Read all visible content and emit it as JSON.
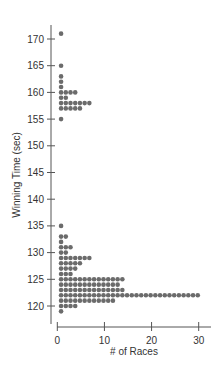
{
  "chart_data": {
    "type": "dot",
    "title": "",
    "xlabel": "# of Races",
    "ylabel": "Winning Time (sec)",
    "xlim": [
      0,
      30
    ],
    "ylim": [
      118,
      172
    ],
    "x_ticks": [
      0,
      10,
      20,
      30
    ],
    "y_ticks": [
      120,
      125,
      130,
      135,
      140,
      145,
      150,
      155,
      160,
      165,
      170
    ],
    "grid": false,
    "dot_color": "#6b6b6b",
    "rows": [
      {
        "time": 171,
        "count": 1
      },
      {
        "time": 165,
        "count": 1
      },
      {
        "time": 163,
        "count": 1
      },
      {
        "time": 162,
        "count": 1
      },
      {
        "time": 161,
        "count": 1
      },
      {
        "time": 160,
        "count": 4
      },
      {
        "time": 159,
        "count": 2
      },
      {
        "time": 158,
        "count": 7
      },
      {
        "time": 157,
        "count": 5
      },
      {
        "time": 155,
        "count": 1
      },
      {
        "time": 135,
        "count": 1
      },
      {
        "time": 133,
        "count": 2
      },
      {
        "time": 132,
        "count": 1
      },
      {
        "time": 131,
        "count": 3
      },
      {
        "time": 130,
        "count": 2
      },
      {
        "time": 129,
        "count": 7
      },
      {
        "time": 128,
        "count": 5
      },
      {
        "time": 127,
        "count": 4
      },
      {
        "time": 126,
        "count": 3
      },
      {
        "time": 125,
        "count": 14
      },
      {
        "time": 124,
        "count": 13
      },
      {
        "time": 123,
        "count": 14
      },
      {
        "time": 122,
        "count": 30
      },
      {
        "time": 121,
        "count": 12
      },
      {
        "time": 120,
        "count": 4
      },
      {
        "time": 119,
        "count": 1
      }
    ]
  }
}
